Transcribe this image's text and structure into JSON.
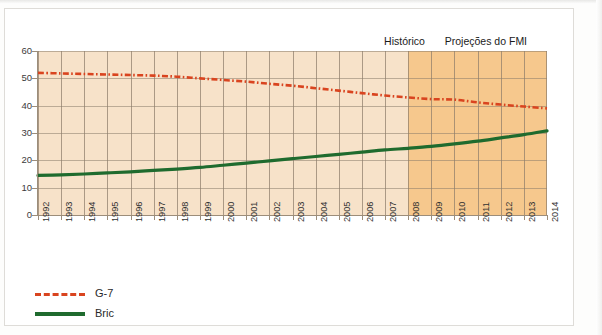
{
  "chart_data": {
    "type": "line",
    "title": "",
    "subtitle": "",
    "xlabel": "",
    "ylabel": "",
    "x": [
      1992,
      1993,
      1994,
      1995,
      1996,
      1997,
      1998,
      1999,
      2000,
      2001,
      2002,
      2003,
      2004,
      2005,
      2006,
      2007,
      2008,
      2009,
      2010,
      2011,
      2012,
      2013,
      2014
    ],
    "xlim": [
      1992,
      2014
    ],
    "ylim": [
      0,
      60
    ],
    "yticks": [
      0,
      10,
      20,
      30,
      40,
      50,
      60
    ],
    "xticks": [
      "1992",
      "1993",
      "1994",
      "1995",
      "1996",
      "1997",
      "1998",
      "1999",
      "2000",
      "2001",
      "2002",
      "2003",
      "2004",
      "2005",
      "2006",
      "2007",
      "2008",
      "2009",
      "2010",
      "2011",
      "2012",
      "2013",
      "2014"
    ],
    "grid": true,
    "legend_position": "bottom-left",
    "series": [
      {
        "name": "G-7",
        "color": "#d9441f",
        "style": "dash-dot",
        "values": [
          52.0,
          51.8,
          51.6,
          51.4,
          51.2,
          51.0,
          50.6,
          50.0,
          49.4,
          48.8,
          48.0,
          47.3,
          46.4,
          45.5,
          44.6,
          43.7,
          43.0,
          42.4,
          42.2,
          41.2,
          40.4,
          39.7,
          39.0
        ]
      },
      {
        "name": "Bric",
        "color": "#1f6b2e",
        "style": "solid",
        "values": [
          14.5,
          14.7,
          15.0,
          15.4,
          15.8,
          16.3,
          16.8,
          17.4,
          18.2,
          19.0,
          19.8,
          20.6,
          21.4,
          22.2,
          23.0,
          23.8,
          24.4,
          25.1,
          26.0,
          27.0,
          28.2,
          29.4,
          30.8
        ]
      }
    ],
    "annotations": [
      {
        "id": "historico",
        "label": "Histórico",
        "x_position_pct": 72.0
      },
      {
        "id": "projecoes-fmi",
        "label": "Projeções do FMI",
        "x_position_pct": 88.0
      }
    ],
    "regions": [
      {
        "id": "historical-region",
        "from": 1992,
        "to": 2008,
        "fill": "#f7e2c9"
      },
      {
        "id": "projection-region",
        "from": 2008,
        "to": 2014,
        "fill": "#f6c88d"
      }
    ]
  },
  "legend": {
    "items": [
      {
        "label": "G-7",
        "color": "#d9441f",
        "style": "dash-dot"
      },
      {
        "label": "Bric",
        "color": "#1f6b2e",
        "style": "solid"
      }
    ]
  },
  "captions": {
    "historical": "Histórico",
    "projection": "Projeções do FMI"
  },
  "colors": {
    "historical_band": "#f7e2c9",
    "projection_band": "#f6c88d",
    "g7_line": "#d9441f",
    "bric_line": "#1f6b2e",
    "grid": "#8d7d6b",
    "axis": "#9c8d7a"
  },
  "credit": {
    "side_text": ""
  }
}
